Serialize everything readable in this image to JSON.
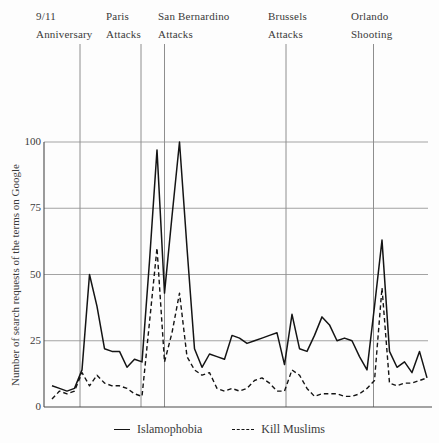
{
  "chart_data": {
    "type": "line",
    "title": "",
    "xlabel": "",
    "ylabel": "Number of search requests of the terms on Google",
    "ylim": [
      0,
      100
    ],
    "yticks": [
      100,
      75,
      50,
      25,
      0
    ],
    "grid": "horizontal",
    "legend_position": "bottom",
    "x_unit": "weeks (unlabeled axis)",
    "events": [
      {
        "label": "9/11\nAnniversary",
        "label_x": 36,
        "line_x": 80
      },
      {
        "label": "Paris\nAttacks",
        "label_x": 106,
        "line_x": 141
      },
      {
        "label": "San Bernardino\nAttacks",
        "label_x": 158,
        "line_x": 164.5
      },
      {
        "label": "Brussels\nAttacks",
        "label_x": 268,
        "line_x": 286
      },
      {
        "label": "Orlando\nShooting",
        "label_x": 351,
        "line_x": 373.5
      }
    ],
    "series": [
      {
        "name": "Islamophobia",
        "style": "solid",
        "values": [
          8,
          7,
          6,
          7,
          14,
          50,
          38,
          22,
          21,
          21,
          15,
          18,
          17,
          55,
          97,
          43,
          72,
          100,
          60,
          22,
          15,
          20,
          19,
          18,
          27,
          26,
          24,
          25,
          26,
          27,
          28,
          16,
          35,
          22,
          21,
          27,
          34,
          31,
          25,
          26,
          25,
          19,
          14,
          38,
          63,
          21,
          15,
          17,
          13,
          21,
          11
        ]
      },
      {
        "name": "Kill Muslims",
        "style": "dashed",
        "values": [
          3,
          6,
          5,
          6,
          13,
          8,
          12,
          9,
          8,
          8,
          7,
          5,
          4,
          32,
          60,
          17,
          28,
          43,
          19,
          14,
          12,
          13,
          7,
          6,
          7,
          6,
          7,
          10,
          11,
          9,
          6,
          6,
          14,
          12,
          7,
          4,
          5,
          5,
          5,
          4,
          4,
          5,
          7,
          10,
          45,
          9,
          8,
          9,
          9,
          10,
          11
        ]
      }
    ]
  },
  "colors": {
    "series_line": "#141414",
    "grid_line": "#a3a3a3",
    "event_line": "#8e8e8e",
    "frame_line": "#4a4a4a",
    "text": "#3a3a3a",
    "background": "#fdfdfd"
  }
}
